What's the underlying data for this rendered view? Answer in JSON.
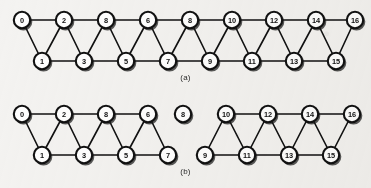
{
  "figure": {
    "background_color": "#f4f3f1",
    "edge_color": "#111111",
    "node_fill": "#ffffff",
    "node_stroke": "#111111"
  },
  "panels": [
    {
      "id": "a",
      "caption": "(a)",
      "node_radius": 8.2,
      "nodes": [
        {
          "id": "a0",
          "label": "0",
          "x": 22,
          "y": 20
        },
        {
          "id": "a2",
          "label": "2",
          "x": 64,
          "y": 20
        },
        {
          "id": "a4",
          "label": "8",
          "x": 106,
          "y": 20
        },
        {
          "id": "a6",
          "label": "6",
          "x": 148,
          "y": 20
        },
        {
          "id": "a8",
          "label": "8",
          "x": 190,
          "y": 20
        },
        {
          "id": "a10",
          "label": "10",
          "x": 232,
          "y": 20
        },
        {
          "id": "a12",
          "label": "12",
          "x": 274,
          "y": 20
        },
        {
          "id": "a14",
          "label": "14",
          "x": 316,
          "y": 20
        },
        {
          "id": "a16",
          "label": "16",
          "x": 355,
          "y": 20
        },
        {
          "id": "a1",
          "label": "1",
          "x": 42,
          "y": 61
        },
        {
          "id": "a3",
          "label": "3",
          "x": 84,
          "y": 61
        },
        {
          "id": "a5",
          "label": "5",
          "x": 126,
          "y": 61
        },
        {
          "id": "a7",
          "label": "7",
          "x": 168,
          "y": 61
        },
        {
          "id": "a9",
          "label": "9",
          "x": 210,
          "y": 61
        },
        {
          "id": "a11",
          "label": "11",
          "x": 252,
          "y": 61
        },
        {
          "id": "a13",
          "label": "13",
          "x": 294,
          "y": 61
        },
        {
          "id": "a15",
          "label": "15",
          "x": 336,
          "y": 61
        }
      ],
      "edges": [
        [
          "a0",
          "a2"
        ],
        [
          "a2",
          "a4"
        ],
        [
          "a4",
          "a6"
        ],
        [
          "a6",
          "a8"
        ],
        [
          "a8",
          "a10"
        ],
        [
          "a10",
          "a12"
        ],
        [
          "a12",
          "a14"
        ],
        [
          "a14",
          "a16"
        ],
        [
          "a1",
          "a3"
        ],
        [
          "a3",
          "a5"
        ],
        [
          "a5",
          "a7"
        ],
        [
          "a7",
          "a9"
        ],
        [
          "a9",
          "a11"
        ],
        [
          "a11",
          "a13"
        ],
        [
          "a13",
          "a15"
        ],
        [
          "a0",
          "a1"
        ],
        [
          "a1",
          "a2"
        ],
        [
          "a2",
          "a3"
        ],
        [
          "a3",
          "a4"
        ],
        [
          "a4",
          "a5"
        ],
        [
          "a5",
          "a6"
        ],
        [
          "a6",
          "a7"
        ],
        [
          "a7",
          "a8"
        ],
        [
          "a8",
          "a9"
        ],
        [
          "a9",
          "a10"
        ],
        [
          "a10",
          "a11"
        ],
        [
          "a11",
          "a12"
        ],
        [
          "a12",
          "a13"
        ],
        [
          "a13",
          "a14"
        ],
        [
          "a14",
          "a15"
        ],
        [
          "a15",
          "a16"
        ]
      ]
    },
    {
      "id": "b",
      "caption": "(b)",
      "node_radius": 8.2,
      "nodes": [
        {
          "id": "b0",
          "label": "0",
          "x": 22,
          "y": 20
        },
        {
          "id": "b2",
          "label": "2",
          "x": 64,
          "y": 20
        },
        {
          "id": "b4",
          "label": "8",
          "x": 106,
          "y": 20
        },
        {
          "id": "b6",
          "label": "6",
          "x": 148,
          "y": 20
        },
        {
          "id": "b1",
          "label": "1",
          "x": 42,
          "y": 61
        },
        {
          "id": "b3",
          "label": "3",
          "x": 84,
          "y": 61
        },
        {
          "id": "b5",
          "label": "5",
          "x": 126,
          "y": 61
        },
        {
          "id": "b7",
          "label": "7",
          "x": 168,
          "y": 61
        },
        {
          "id": "b8",
          "label": "8",
          "x": 183,
          "y": 20
        },
        {
          "id": "b10",
          "label": "10",
          "x": 226,
          "y": 20
        },
        {
          "id": "b12",
          "label": "12",
          "x": 268,
          "y": 20
        },
        {
          "id": "b14",
          "label": "14",
          "x": 310,
          "y": 20
        },
        {
          "id": "b16",
          "label": "16",
          "x": 352,
          "y": 20
        },
        {
          "id": "b9",
          "label": "9",
          "x": 205,
          "y": 61
        },
        {
          "id": "b11",
          "label": "11",
          "x": 247,
          "y": 61
        },
        {
          "id": "b13",
          "label": "13",
          "x": 289,
          "y": 61
        },
        {
          "id": "b15",
          "label": "15",
          "x": 331,
          "y": 61
        }
      ],
      "edges": [
        [
          "b0",
          "b2"
        ],
        [
          "b2",
          "b4"
        ],
        [
          "b4",
          "b6"
        ],
        [
          "b1",
          "b3"
        ],
        [
          "b3",
          "b5"
        ],
        [
          "b5",
          "b7"
        ],
        [
          "b0",
          "b1"
        ],
        [
          "b1",
          "b2"
        ],
        [
          "b2",
          "b3"
        ],
        [
          "b3",
          "b4"
        ],
        [
          "b4",
          "b5"
        ],
        [
          "b5",
          "b6"
        ],
        [
          "b6",
          "b7"
        ],
        [
          "b10",
          "b12"
        ],
        [
          "b12",
          "b14"
        ],
        [
          "b14",
          "b16"
        ],
        [
          "b9",
          "b11"
        ],
        [
          "b11",
          "b13"
        ],
        [
          "b13",
          "b15"
        ],
        [
          "b9",
          "b10"
        ],
        [
          "b10",
          "b11"
        ],
        [
          "b11",
          "b12"
        ],
        [
          "b12",
          "b13"
        ],
        [
          "b13",
          "b14"
        ],
        [
          "b14",
          "b15"
        ],
        [
          "b15",
          "b16"
        ]
      ],
      "isolated_nodes": [
        "b8"
      ]
    }
  ]
}
